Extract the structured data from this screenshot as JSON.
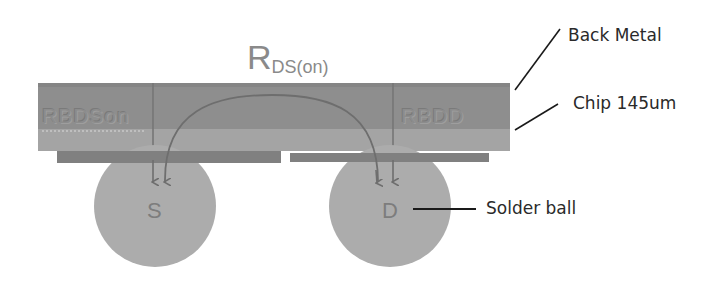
{
  "title_formula": {
    "main": "R",
    "subscript": "DS(on)"
  },
  "regions": {
    "left_label": "RBDSon",
    "right_label": "RBDD"
  },
  "terminals": {
    "source": "S",
    "drain": "D"
  },
  "callouts": {
    "back_metal": "Back Metal",
    "chip": "Chip 145um",
    "solder_ball": "Solder ball"
  },
  "colors": {
    "back_metal_layer": "#8c8c8c",
    "chip_layer": "#a3a3a3",
    "pad": "#7f7f7f",
    "solder_ball": "#ababab",
    "current_path": "#6e6e6e",
    "leader_line": "#1a1a1a"
  }
}
